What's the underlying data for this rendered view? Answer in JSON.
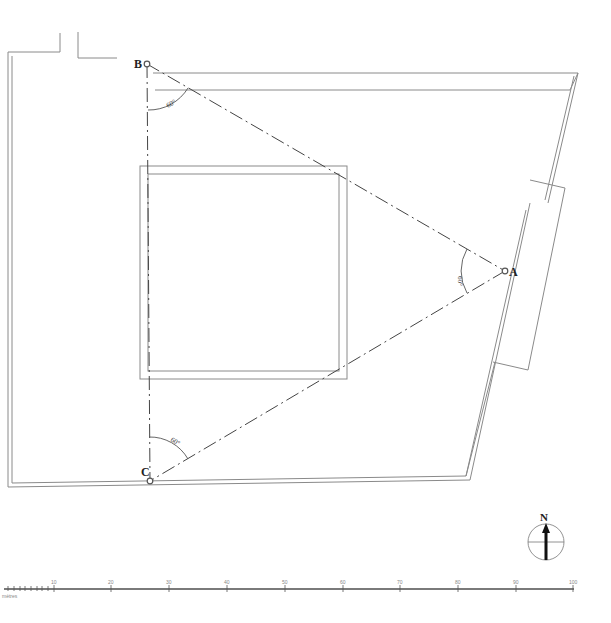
{
  "drawing": {
    "type": "site-plan",
    "points": [
      {
        "id": "A",
        "label": "A",
        "x": 505,
        "y": 271
      },
      {
        "id": "B",
        "label": "B",
        "x": 147,
        "y": 64
      },
      {
        "id": "C",
        "label": "C",
        "x": 150,
        "y": 481
      }
    ],
    "angles": [
      {
        "at": "B",
        "label": "60°"
      },
      {
        "at": "A",
        "label": "60°"
      },
      {
        "at": "C",
        "label": "60°"
      }
    ]
  },
  "compass": {
    "label": "N"
  },
  "scale_bar": {
    "ticks": [
      "10",
      "20",
      "30",
      "40",
      "50",
      "60",
      "70",
      "80",
      "90",
      "100"
    ],
    "unit_label": "mètres"
  },
  "colors": {
    "line": "#8a8a8a",
    "dash": "#444444",
    "background": "#ffffff"
  }
}
